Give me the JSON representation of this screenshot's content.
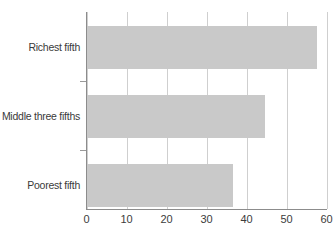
{
  "chart_data": {
    "type": "bar",
    "orientation": "horizontal",
    "title": "",
    "xlabel": "",
    "ylabel": "",
    "categories": [
      "Poorest fifth",
      "Middle three fifths",
      "Richest fifth"
    ],
    "values": [
      36.6,
      44.7,
      57.6
    ],
    "series": [
      {
        "name": "",
        "values": [
          36.6,
          44.7,
          57.6
        ]
      }
    ],
    "xlim": [
      0,
      60
    ],
    "xticks": [
      0,
      10,
      20,
      30,
      40,
      50,
      60
    ],
    "xtick_labels": [
      "0",
      "10",
      "20",
      "30",
      "40",
      "50",
      "60"
    ],
    "grid": "vertical",
    "legend": "none",
    "bar_color": "#c9c9c9",
    "axis_color": "#8c8c8c",
    "grid_color": "#cfcfcf",
    "text_color": "#3a3a3a",
    "background": "#ffffff"
  }
}
